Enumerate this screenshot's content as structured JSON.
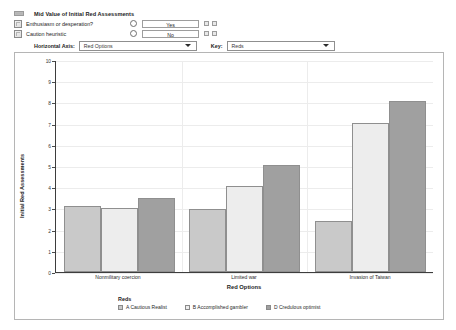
{
  "panel": {
    "title": "Mid Value of Initial Red Assessments",
    "title_icon": "window-icon",
    "rows": [
      {
        "icon": "variable-icon",
        "label": "Enthusiasm or desperation?",
        "value": "Yes",
        "buttons": [
          "copy-button",
          "paste-button"
        ]
      },
      {
        "icon": "variable-icon",
        "label": "Caution heuristic",
        "value": "No",
        "buttons": [
          "copy-button",
          "paste-button"
        ]
      }
    ],
    "horizontal_axis": {
      "label": "Horizontal Axis:",
      "selected": "Red Options"
    },
    "key": {
      "label": "Key:",
      "selected": "Reds"
    }
  },
  "chart_data": {
    "type": "bar",
    "title": "",
    "xlabel": "Red Options",
    "ylabel": "Initial Red Assessments",
    "categories": [
      "Nonmilitary coercion",
      "Limited war",
      "Invasion of Taiwan"
    ],
    "series": [
      {
        "name": "A Cautious Realist",
        "values": [
          3.1,
          2.95,
          2.4
        ],
        "color": "#c9c9c9"
      },
      {
        "name": "B Accomplished gambler",
        "values": [
          3.0,
          4.05,
          7.05
        ],
        "color": "#ededed"
      },
      {
        "name": "D Credulous optimist",
        "values": [
          3.5,
          5.05,
          8.1
        ],
        "color": "#a0a0a0"
      }
    ],
    "ylim": [
      0,
      10
    ],
    "yticks": [
      10,
      9,
      8,
      7,
      6,
      5,
      4,
      3,
      2,
      1,
      0
    ],
    "grid": true,
    "legend_title": "Reds",
    "legend_position": "bottom"
  }
}
